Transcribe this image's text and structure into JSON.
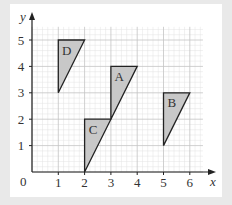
{
  "diagram": {
    "type": "coordinate-grid",
    "axes": {
      "x_label": "x",
      "y_label": "y",
      "origin_label": "0",
      "x_ticks": [
        "1",
        "2",
        "3",
        "4",
        "5",
        "6"
      ],
      "y_ticks": [
        "1",
        "2",
        "3",
        "4",
        "5"
      ],
      "x_range": [
        0,
        6.5
      ],
      "y_range": [
        0,
        5.5
      ],
      "minor_grid_per_unit": 5
    },
    "shapes": [
      {
        "label": "A",
        "vertices": [
          [
            3,
            2
          ],
          [
            3,
            4
          ],
          [
            4,
            4
          ]
        ]
      },
      {
        "label": "B",
        "vertices": [
          [
            5,
            1
          ],
          [
            5,
            3
          ],
          [
            6,
            3
          ]
        ]
      },
      {
        "label": "C",
        "vertices": [
          [
            2,
            0
          ],
          [
            2,
            2
          ],
          [
            3,
            2
          ]
        ]
      },
      {
        "label": "D",
        "vertices": [
          [
            1,
            3
          ],
          [
            1,
            5
          ],
          [
            2,
            5
          ]
        ]
      }
    ],
    "colors": {
      "background": "#e9e9e9",
      "card": "#ffffff",
      "minor_grid": "#e3e3e3",
      "major_grid": "#c4c4c4",
      "shape_fill": "#c8c8c8",
      "stroke": "#222222"
    }
  }
}
